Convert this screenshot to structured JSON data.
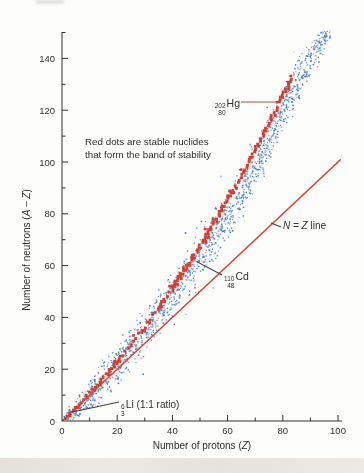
{
  "chart_data": {
    "type": "scatter",
    "title": "",
    "xlabel": {
      "prefix": "Number of protons (",
      "var": "Z",
      "suffix": ")"
    },
    "ylabel": {
      "prefix": "Number of neutrons (",
      "var": "A − Z",
      "suffix": ")"
    },
    "xlim": [
      0,
      104
    ],
    "ylim": [
      0,
      152
    ],
    "x_major_ticks": [
      0,
      20,
      40,
      60,
      80,
      100
    ],
    "x_minor_ticks": [
      10,
      30,
      50,
      70,
      90
    ],
    "y_major_ticks": [
      0,
      20,
      40,
      60,
      80,
      100,
      120,
      140
    ],
    "y_minor_ticks": [
      10,
      30,
      50,
      70,
      90,
      110,
      130,
      150
    ],
    "grid": false,
    "legend": "none",
    "note": {
      "line1": "Red dots are stable nuclides",
      "line2": "that form the band of stability"
    },
    "n_equals_z_line": {
      "label_math": "N = Z",
      "label_suffix": " line",
      "from": [
        0,
        0
      ],
      "to": [
        101,
        101
      ],
      "color": "#e0402f"
    },
    "colors": {
      "stable": "#dc3a2b",
      "unstable": "#4d7fc9",
      "unstable_light": "#7aa2d8",
      "axis": "#2f2f2f",
      "hg_pointer": "#b5493f",
      "black_pointer": "#3c3c3c"
    },
    "series": [
      {
        "name": "unstable-nuclides-cloud",
        "marker": "dot",
        "band_centerline": [
          [
            0,
            0
          ],
          [
            6,
            6
          ],
          [
            12,
            13
          ],
          [
            18,
            20
          ],
          [
            24,
            27
          ],
          [
            30,
            35
          ],
          [
            36,
            44
          ],
          [
            42,
            52
          ],
          [
            48,
            62
          ],
          [
            54,
            70
          ],
          [
            60,
            80
          ],
          [
            66,
            91
          ],
          [
            72,
            103
          ],
          [
            78,
            115
          ],
          [
            82,
            126
          ],
          [
            86,
            133
          ],
          [
            90,
            140
          ],
          [
            94,
            147
          ],
          [
            97,
            150
          ]
        ],
        "band_halfwidth": [
          [
            0,
            3
          ],
          [
            10,
            6
          ],
          [
            20,
            8
          ],
          [
            30,
            9
          ],
          [
            45,
            10
          ],
          [
            60,
            10
          ],
          [
            75,
            10
          ],
          [
            85,
            8
          ],
          [
            93,
            6
          ],
          [
            97,
            4
          ]
        ],
        "dot_count": 1400,
        "z_range": [
          0,
          97
        ]
      },
      {
        "name": "stable-nuclides-band",
        "marker": "square",
        "centerline": [
          [
            1,
            1
          ],
          [
            10,
            11
          ],
          [
            20,
            22
          ],
          [
            30,
            35
          ],
          [
            40,
            50
          ],
          [
            48,
            62
          ],
          [
            60,
            81
          ],
          [
            70,
            101
          ],
          [
            80,
            122
          ],
          [
            83,
            126
          ]
        ],
        "z_range": [
          1,
          83
        ],
        "n_formula": "N ≈ Z + Z²/140"
      }
    ],
    "callouts": {
      "hg": {
        "mass": "202",
        "atomic": "80",
        "symbol": "Hg",
        "points_to": [
          80,
          122
        ]
      },
      "cd": {
        "mass": "110",
        "atomic": "48",
        "symbol": "Cd",
        "points_to": [
          48,
          62
        ]
      },
      "li": {
        "mass": "6",
        "atomic": "3",
        "symbol": "Li",
        "suffix": " (1:1 ratio)",
        "points_to": [
          3,
          3
        ]
      }
    }
  }
}
